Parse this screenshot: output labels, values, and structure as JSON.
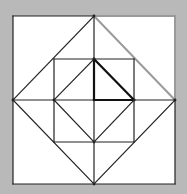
{
  "canvas": {
    "width": 187,
    "height": 194,
    "background": "#b9b9b9",
    "fill": "#ffffff"
  },
  "figure": {
    "outer_square": {
      "x1": 13,
      "y1": 16,
      "x2": 175,
      "y2": 184
    },
    "inner_square": {
      "x1": 54,
      "y1": 59,
      "x2": 134,
      "y2": 142
    },
    "center": {
      "x": 94,
      "y": 100
    },
    "colors": {
      "line": "#222222",
      "highlight_bold": "#111111",
      "faded": "#9a9a9a"
    },
    "lines": [
      {
        "id": "outer-top-left-half",
        "x1": 13,
        "y1": 16,
        "x2": 94,
        "y2": 16,
        "style": "line"
      },
      {
        "id": "outer-top-right-half",
        "x1": 94,
        "y1": 16,
        "x2": 175,
        "y2": 16,
        "style": "faded"
      },
      {
        "id": "outer-right-upper",
        "x1": 175,
        "y1": 16,
        "x2": 175,
        "y2": 100,
        "style": "faded"
      },
      {
        "id": "outer-right-lower",
        "x1": 175,
        "y1": 100,
        "x2": 175,
        "y2": 184,
        "style": "line"
      },
      {
        "id": "outer-bottom",
        "x1": 13,
        "y1": 184,
        "x2": 175,
        "y2": 184,
        "style": "line"
      },
      {
        "id": "outer-left",
        "x1": 13,
        "y1": 16,
        "x2": 13,
        "y2": 184,
        "style": "line"
      },
      {
        "id": "diamond-top-left",
        "x1": 94,
        "y1": 16,
        "x2": 13,
        "y2": 100,
        "style": "line"
      },
      {
        "id": "diamond-top-right",
        "x1": 94,
        "y1": 16,
        "x2": 175,
        "y2": 100,
        "style": "faded"
      },
      {
        "id": "diamond-bottom-left",
        "x1": 13,
        "y1": 100,
        "x2": 94,
        "y2": 184,
        "style": "line"
      },
      {
        "id": "diamond-bottom-right",
        "x1": 175,
        "y1": 100,
        "x2": 94,
        "y2": 184,
        "style": "line"
      },
      {
        "id": "vertical-axis-top",
        "x1": 94,
        "y1": 16,
        "x2": 94,
        "y2": 59,
        "style": "line"
      },
      {
        "id": "vertical-axis-mid-upper",
        "x1": 94,
        "y1": 59,
        "x2": 94,
        "y2": 100,
        "style": "bold"
      },
      {
        "id": "vertical-axis-mid-lower",
        "x1": 94,
        "y1": 100,
        "x2": 94,
        "y2": 142,
        "style": "line"
      },
      {
        "id": "vertical-axis-bottom",
        "x1": 94,
        "y1": 142,
        "x2": 94,
        "y2": 184,
        "style": "line"
      },
      {
        "id": "horizontal-axis-left",
        "x1": 13,
        "y1": 100,
        "x2": 94,
        "y2": 100,
        "style": "line"
      },
      {
        "id": "horizontal-axis-right-inner",
        "x1": 94,
        "y1": 100,
        "x2": 134,
        "y2": 100,
        "style": "bold"
      },
      {
        "id": "horizontal-axis-right-outer",
        "x1": 134,
        "y1": 100,
        "x2": 175,
        "y2": 100,
        "style": "line"
      },
      {
        "id": "inner-square-top",
        "x1": 54,
        "y1": 59,
        "x2": 134,
        "y2": 59,
        "style": "line"
      },
      {
        "id": "inner-square-bottom",
        "x1": 54,
        "y1": 142,
        "x2": 134,
        "y2": 142,
        "style": "line"
      },
      {
        "id": "inner-square-left",
        "x1": 54,
        "y1": 59,
        "x2": 54,
        "y2": 142,
        "style": "line"
      },
      {
        "id": "inner-square-right",
        "x1": 134,
        "y1": 59,
        "x2": 134,
        "y2": 142,
        "style": "line"
      },
      {
        "id": "inner-diamond-top-left",
        "x1": 94,
        "y1": 59,
        "x2": 54,
        "y2": 100,
        "style": "line"
      },
      {
        "id": "inner-diamond-top-right",
        "x1": 94,
        "y1": 59,
        "x2": 134,
        "y2": 100,
        "style": "bold"
      },
      {
        "id": "inner-diamond-bottom-left",
        "x1": 54,
        "y1": 100,
        "x2": 94,
        "y2": 142,
        "style": "line"
      },
      {
        "id": "inner-diamond-bottom-right",
        "x1": 134,
        "y1": 100,
        "x2": 94,
        "y2": 142,
        "style": "line"
      }
    ],
    "points": [
      {
        "id": "top-mid",
        "x": 94,
        "y": 16
      },
      {
        "id": "left-mid",
        "x": 13,
        "y": 100
      },
      {
        "id": "right-mid",
        "x": 175,
        "y": 100
      },
      {
        "id": "bottom-mid",
        "x": 94,
        "y": 184
      },
      {
        "id": "inner-top",
        "x": 94,
        "y": 59
      },
      {
        "id": "inner-left",
        "x": 54,
        "y": 100
      },
      {
        "id": "inner-right",
        "x": 134,
        "y": 100
      },
      {
        "id": "inner-bottom",
        "x": 94,
        "y": 142
      }
    ],
    "highlighted_triangle": [
      {
        "x": 94,
        "y": 59
      },
      {
        "x": 134,
        "y": 100
      },
      {
        "x": 94,
        "y": 100
      }
    ]
  }
}
